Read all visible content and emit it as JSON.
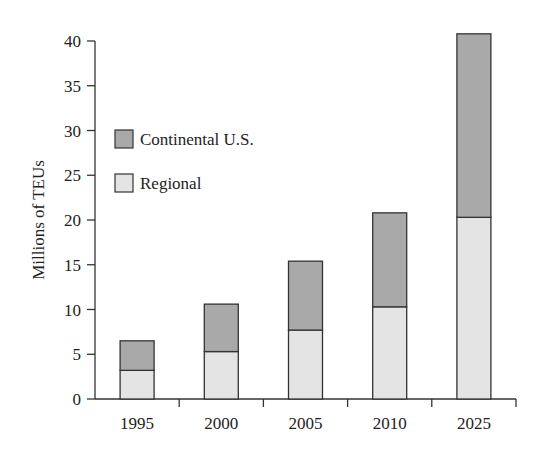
{
  "chart_data": {
    "type": "bar",
    "stacked": true,
    "title": "",
    "xlabel": "",
    "ylabel": "Millions of TEUs",
    "ylim": [
      0,
      40
    ],
    "yticks": [
      0,
      5,
      10,
      15,
      20,
      25,
      30,
      35,
      40
    ],
    "categories": [
      "1995",
      "2000",
      "2005",
      "2010",
      "2025"
    ],
    "series": [
      {
        "name": "Regional",
        "color": "#e4e4e4",
        "values": [
          3.2,
          5.3,
          7.7,
          10.3,
          20.3
        ]
      },
      {
        "name": "Continental U.S.",
        "color": "#a9a9a9",
        "values": [
          3.3,
          5.3,
          7.7,
          10.5,
          20.5
        ]
      }
    ],
    "totals": [
      6.5,
      10.6,
      15.4,
      20.8,
      40.8
    ],
    "legend": {
      "position": "upper-left",
      "entries": [
        "Continental U.S.",
        "Regional"
      ]
    },
    "grid": false
  }
}
